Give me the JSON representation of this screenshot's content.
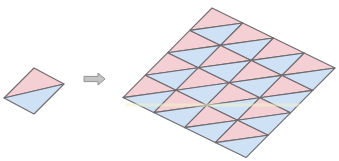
{
  "figure": {
    "width": 339,
    "height": 161,
    "colors": {
      "pink": "#f4d0d5",
      "blue": "#cfe2f5",
      "line": "#6e6a6e",
      "arrow_fill": "#c4c4c4",
      "arrow_stroke": "#8a8a8a",
      "highlight": "#eef3c8"
    },
    "single_tile": {
      "label": "single-tile",
      "top": [
        34,
        68
      ],
      "u": [
        30,
        16
      ],
      "v": [
        -30,
        30
      ],
      "rows": 1,
      "cols": 1
    },
    "arrow": {
      "icon": "right-arrow-icon",
      "x1": 84,
      "x2": 105,
      "y": 79
    },
    "tiled_grid": {
      "label": "tiled-grid",
      "top": [
        212,
        8
      ],
      "u": [
        30.75,
        15
      ],
      "v": [
        -22.25,
        22.4
      ],
      "rows": 4,
      "cols": 4
    },
    "highlight_band": {
      "y": 105,
      "x1": 125,
      "x2": 300
    }
  }
}
